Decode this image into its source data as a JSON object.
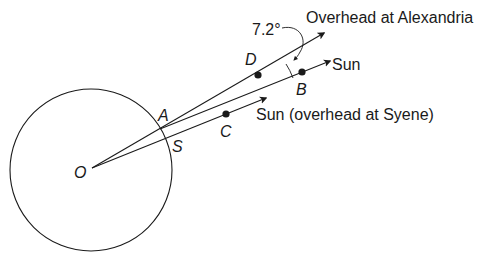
{
  "diagram": {
    "points": {
      "O": "O",
      "A": "A",
      "S": "S",
      "B": "B",
      "C": "C",
      "D": "D"
    },
    "labels": {
      "overhead_alexandria": "Overhead at Alexandria",
      "sun_parallel": "Sun",
      "sun_syene": "Sun (overhead at Syene)",
      "angle": "7.2°"
    },
    "colors": {
      "stroke": "#1a1a1a",
      "background": "#ffffff"
    }
  }
}
